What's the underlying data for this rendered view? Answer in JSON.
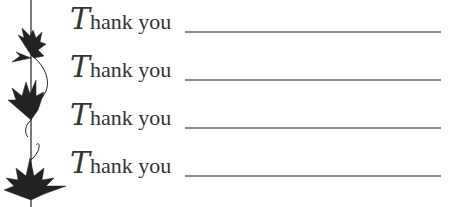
{
  "rows": [
    {
      "cap": "T",
      "rest": "hank you"
    },
    {
      "cap": "T",
      "rest": "hank you"
    },
    {
      "cap": "T",
      "rest": "hank you"
    },
    {
      "cap": "T",
      "rest": "hank you"
    }
  ],
  "colors": {
    "ink": "#333333",
    "rule": "#8a8a8a"
  }
}
